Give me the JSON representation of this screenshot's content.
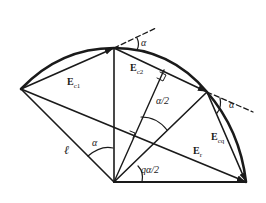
{
  "diagram": {
    "type": "geometric vector diagram (circular arc with chord vectors)",
    "stroke_color": "#1a1a1a",
    "points": {
      "origin": [
        114,
        182
      ],
      "left": [
        21,
        89
      ],
      "top": [
        114,
        48
      ],
      "right": [
        207,
        92
      ],
      "bottom_right": [
        246,
        182
      ]
    },
    "labels": {
      "e1": {
        "main": "E",
        "sub": "c1"
      },
      "e2": {
        "main": "E",
        "sub": "c2"
      },
      "eq": {
        "main": "E",
        "sub": "cq"
      },
      "er": {
        "main": "E",
        "sub": "r"
      },
      "ell": "ℓ",
      "alpha_center": "α",
      "alpha_top": "α",
      "alpha_right": "α",
      "alpha_half": "α/2",
      "q_alpha_half": "qα/2"
    }
  }
}
